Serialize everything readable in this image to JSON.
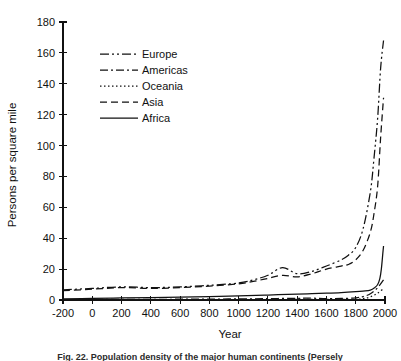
{
  "figure": {
    "caption": "Fig. 22.   Population density of the major human continents (Persely"
  },
  "chart_data": {
    "type": "line",
    "title": "",
    "xlabel": "Year",
    "ylabel": "Persons per square mile",
    "xlim": [
      -200,
      2000
    ],
    "ylim": [
      0,
      180
    ],
    "xticks": [
      -200,
      0,
      200,
      400,
      600,
      800,
      1000,
      1200,
      1400,
      1600,
      1800,
      2000
    ],
    "xtick_labels": [
      "-200",
      "0",
      "200",
      "400",
      "600",
      "800",
      "1000",
      "1200",
      "1400",
      "1600",
      "1800",
      "2000"
    ],
    "yticks": [
      0,
      20,
      40,
      60,
      80,
      100,
      120,
      140,
      160,
      180
    ],
    "ytick_labels": [
      "0",
      "20",
      "40",
      "60",
      "80",
      "100",
      "120",
      "140",
      "160",
      "180"
    ],
    "grid": false,
    "legend_position": "upper-left",
    "series": [
      {
        "name": "Europe",
        "dash": "dash-dot-dot",
        "dasharray": "9,3,2,3,2,3",
        "x": [
          -200,
          0,
          200,
          400,
          600,
          800,
          1000,
          1100,
          1200,
          1300,
          1400,
          1500,
          1600,
          1700,
          1750,
          1800,
          1850,
          1900,
          1925,
          1950,
          1970,
          1990
        ],
        "y": [
          6.5,
          7.5,
          8.5,
          8.0,
          8.5,
          9.5,
          11.0,
          13.0,
          16.0,
          21.0,
          17.0,
          18.5,
          22.0,
          26.0,
          29.0,
          34.0,
          46.0,
          70.0,
          92.0,
          118.0,
          150.0,
          168.0
        ]
      },
      {
        "name": "Americas",
        "dash": "dash-dot",
        "dasharray": "8,3,2,3",
        "x": [
          -200,
          0,
          200,
          400,
          600,
          800,
          1000,
          1200,
          1400,
          1500,
          1600,
          1700,
          1800,
          1850,
          1900,
          1950,
          1990
        ],
        "y": [
          0.3,
          0.35,
          0.4,
          0.45,
          0.5,
          0.6,
          0.7,
          0.9,
          1.1,
          1.2,
          0.9,
          1.0,
          1.4,
          2.2,
          4.0,
          8.0,
          13.0
        ]
      },
      {
        "name": "Oceania",
        "dash": "dotted",
        "dasharray": "1.5,2.5",
        "x": [
          -200,
          0,
          400,
          800,
          1200,
          1500,
          1700,
          1800,
          1850,
          1900,
          1950,
          1990
        ],
        "y": [
          0.15,
          0.18,
          0.2,
          0.25,
          0.3,
          0.35,
          0.4,
          0.5,
          0.9,
          2.0,
          4.5,
          7.5
        ]
      },
      {
        "name": "Asia",
        "dash": "dashed",
        "dasharray": "7,4",
        "x": [
          -200,
          0,
          200,
          400,
          600,
          800,
          1000,
          1100,
          1200,
          1300,
          1400,
          1500,
          1600,
          1700,
          1750,
          1800,
          1850,
          1900,
          1925,
          1950,
          1970,
          1990
        ],
        "y": [
          6.0,
          7.0,
          8.0,
          7.5,
          8.0,
          9.0,
          10.5,
          12.0,
          14.0,
          16.0,
          15.0,
          17.0,
          20.0,
          22.0,
          23.0,
          26.0,
          32.0,
          44.0,
          56.0,
          74.0,
          105.0,
          131.0
        ]
      },
      {
        "name": "Africa",
        "dash": "solid",
        "dasharray": "",
        "x": [
          -200,
          0,
          200,
          400,
          600,
          800,
          1000,
          1200,
          1400,
          1500,
          1600,
          1700,
          1800,
          1850,
          1900,
          1930,
          1950,
          1965,
          1975,
          1985,
          1990
        ],
        "y": [
          0.8,
          1.0,
          1.3,
          1.6,
          1.9,
          2.2,
          2.6,
          3.2,
          3.8,
          4.1,
          4.4,
          4.8,
          5.4,
          5.8,
          6.4,
          8.0,
          10.0,
          14.0,
          20.0,
          30.0,
          35.0
        ]
      }
    ]
  }
}
